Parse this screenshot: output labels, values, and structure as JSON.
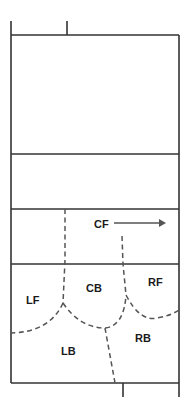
{
  "diagram": {
    "title": "",
    "type": "volleyball court zone diagram",
    "colors": {
      "line": "#333333",
      "dashed": "#555555",
      "text": "#1a1a1a",
      "background": "#ffffff"
    },
    "zones": [
      {
        "id": "cf",
        "label": "CF"
      },
      {
        "id": "lf",
        "label": "LF"
      },
      {
        "id": "cb",
        "label": "CB"
      },
      {
        "id": "rf",
        "label": "RF"
      },
      {
        "id": "lb",
        "label": "LB"
      },
      {
        "id": "rb",
        "label": "RB"
      }
    ],
    "arrow": {
      "direction": "right",
      "from_label": "CF"
    }
  }
}
